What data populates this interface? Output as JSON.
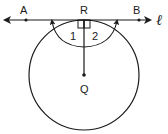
{
  "diagram": {
    "type": "geometry",
    "stroke_color": "#1a1a1a",
    "labels": {
      "A": "A",
      "R": "R",
      "B": "B",
      "line": "ℓ",
      "Q": "Q",
      "angle1": "1",
      "angle2": "2"
    },
    "points": {
      "A": [
        26,
        20
      ],
      "R": [
        84,
        20
      ],
      "B": [
        139,
        20
      ],
      "Q": [
        84,
        75
      ]
    },
    "circle": {
      "center": [
        84,
        75
      ],
      "radius": 55
    },
    "tangent_line": {
      "from": [
        5,
        20
      ],
      "to": [
        150,
        20
      ],
      "arrows": "both"
    },
    "right_angle_marks": 2
  }
}
